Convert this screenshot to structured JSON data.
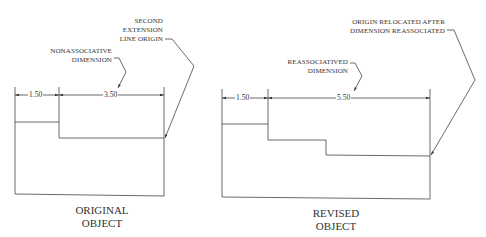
{
  "figures": [
    {
      "id": "original",
      "caption": [
        "ORIGINAL",
        "OBJECT"
      ],
      "dimensions": [
        {
          "label": "1.50"
        },
        {
          "label": "3.50"
        }
      ],
      "callouts": [
        {
          "id": "nonassociative",
          "lines": [
            "NONASSOCIATIVE",
            "DIMENSION"
          ]
        },
        {
          "id": "second-ext-origin",
          "lines": [
            "SECOND",
            "EXTENSION",
            "LINE ORIGIN"
          ]
        }
      ]
    },
    {
      "id": "revised",
      "caption": [
        "REVISED",
        "OBJECT"
      ],
      "dimensions": [
        {
          "label": "1.50"
        },
        {
          "label": "5.50"
        }
      ],
      "callouts": [
        {
          "id": "reassociatived",
          "lines": [
            "REASSOCIATIVED",
            "DIMENSION"
          ]
        },
        {
          "id": "origin-relocated",
          "lines": [
            "ORIGIN RELOCATED AFTER",
            "DIMENSION REASSOCIATED"
          ]
        }
      ]
    }
  ],
  "colors": {
    "line": "#333333",
    "background": "#ffffff"
  }
}
